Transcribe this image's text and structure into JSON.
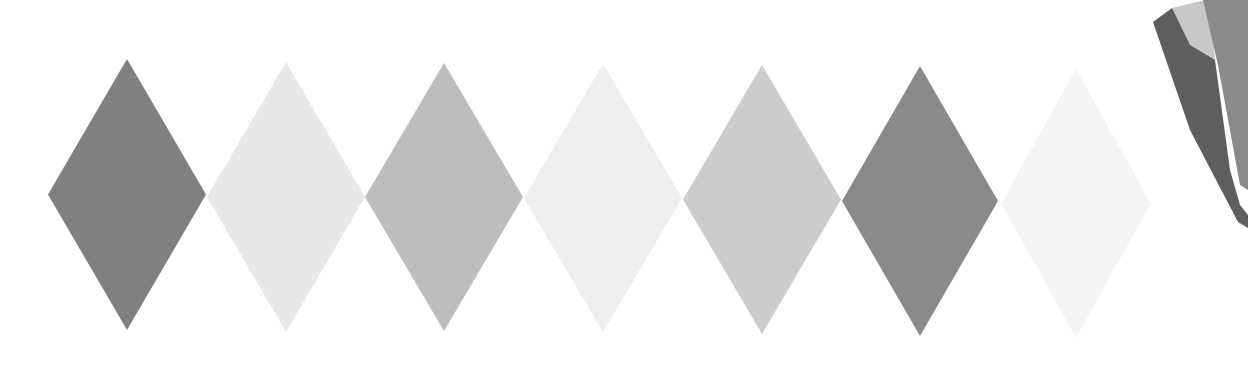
{
  "diagram": {
    "diamonds": [
      {
        "index": 1,
        "cx": 127,
        "top": 59,
        "bottom": 330,
        "halfwidth": 79,
        "color": "#808080"
      },
      {
        "index": 2,
        "cx": 286,
        "top": 62,
        "bottom": 332,
        "halfwidth": 79,
        "color": "#e8e8e8"
      },
      {
        "index": 3,
        "cx": 444,
        "top": 63,
        "bottom": 331,
        "halfwidth": 79,
        "color": "#bdbdbd"
      },
      {
        "index": 4,
        "cx": 603,
        "top": 64,
        "bottom": 332,
        "halfwidth": 79,
        "color": "#eeeeee"
      },
      {
        "index": 5,
        "cx": 762,
        "top": 65,
        "bottom": 334,
        "halfwidth": 79,
        "color": "#cccccc"
      },
      {
        "index": 6,
        "cx": 920,
        "top": 66,
        "bottom": 336,
        "halfwidth": 78,
        "color": "#8a8a8a"
      },
      {
        "index": 7,
        "cx": 1076,
        "top": 69,
        "bottom": 338,
        "halfwidth": 75,
        "color": "#f4f4f4"
      }
    ],
    "edge_shape": {
      "colors": {
        "back": "#5e5e5e",
        "light": "#c8c8c8",
        "front": "#8a8a8a"
      }
    }
  }
}
